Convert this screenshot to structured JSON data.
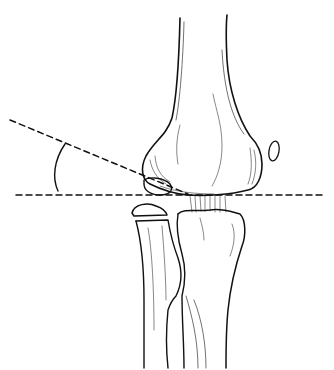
{
  "figure": {
    "elements": {
      "humerus": "distal humerus shaft and condyles",
      "capitellum_fragment": "small ossification fragment at lateral condyle",
      "medial_epicondyle_fragment": "small oval ossicle on right side",
      "radial_head_fragment": "flat ossicle above radius",
      "radius": "left forearm bone",
      "ulna": "right forearm bone",
      "horizontal_line": "dashed horizontal reference line",
      "oblique_line": "dashed oblique line along physis",
      "angle_arc": "arc marking angle between the two lines"
    },
    "colors": {
      "stroke": "#111111",
      "background": "#ffffff"
    }
  }
}
